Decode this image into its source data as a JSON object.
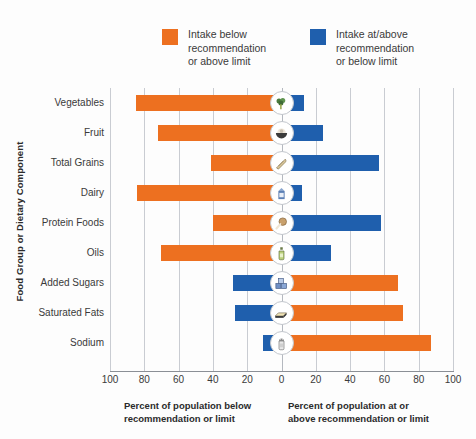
{
  "chart_data": {
    "type": "bar",
    "orientation": "horizontal",
    "subtype": "diverging-bar",
    "title": "",
    "xlabel_left": "Percent of population below recommendation or limit",
    "xlabel_right": "Percent of population at or above recommendation or limit",
    "ylabel": "Food Group or Dietary Component",
    "xlim": [
      -100,
      100
    ],
    "xticks": [
      -100,
      -80,
      -60,
      -40,
      -20,
      0,
      20,
      40,
      60,
      80,
      100
    ],
    "xtick_labels": [
      "100",
      "80",
      "60",
      "40",
      "20",
      "0",
      "20",
      "40",
      "60",
      "80",
      "100"
    ],
    "grid": true,
    "legend_position": "top",
    "colors": {
      "negative": "#ED7020",
      "positive": "#1F5FAD",
      "gridline": "#c9ccd2",
      "axis": "#8b8f96",
      "text": "#3a3a3a"
    },
    "legend": [
      {
        "label": "Intake below recommendation or above limit",
        "color": "#ED7020",
        "key": "negative"
      },
      {
        "label": "Intake at/above recommendation or below limit",
        "color": "#1F5FAD",
        "key": "positive"
      }
    ],
    "categories": [
      "Vegetables",
      "Fruit",
      "Total Grains",
      "Dairy",
      "Protein Foods",
      "Oils",
      "Added Sugars",
      "Saturated Fats",
      "Sodium"
    ],
    "series": [
      {
        "name": "Intake below recommendation or above limit",
        "color": "#ED7020",
        "values": [
          85,
          72,
          41,
          84,
          40,
          70,
          0,
          0,
          0
        ]
      },
      {
        "name": "Intake at/above recommendation or below limit",
        "color": "#1F5FAD",
        "values": [
          13,
          24,
          57,
          12,
          58,
          29,
          0,
          0,
          0
        ]
      }
    ],
    "rows": [
      {
        "category": "Vegetables",
        "below": 85,
        "above": 13,
        "icon": "broccoli-icon"
      },
      {
        "category": "Fruit",
        "below": 72,
        "above": 24,
        "icon": "fruit-bowl-icon"
      },
      {
        "category": "Total Grains",
        "below": 41,
        "above": 57,
        "icon": "grain-bread-icon"
      },
      {
        "category": "Dairy",
        "below": 84,
        "above": 12,
        "icon": "milk-carton-icon"
      },
      {
        "category": "Protein Foods",
        "below": 40,
        "above": 58,
        "icon": "protein-drumstick-icon"
      },
      {
        "category": "Oils",
        "below": 70,
        "above": 29,
        "icon": "oil-bottle-icon"
      },
      {
        "category": "Added Sugars",
        "below": 68,
        "above": 28,
        "icon": "sugar-cubes-icon",
        "flipped": true
      },
      {
        "category": "Saturated Fats",
        "below": 71,
        "above": 27,
        "icon": "butter-icon",
        "flipped": true
      },
      {
        "category": "Sodium",
        "below": 87,
        "above": 11,
        "icon": "salt-shaker-icon",
        "flipped": true
      }
    ]
  },
  "legend": {
    "left": {
      "line1": "Intake below",
      "line2": "recommendation",
      "line3": "or above limit",
      "color": "#ED7020"
    },
    "right": {
      "line1": "Intake at/above",
      "line2": "recommendation",
      "line3": "or below limit",
      "color": "#1F5FAD"
    }
  },
  "axis": {
    "y_title": "Food Group or Dietary Component",
    "caption_left": {
      "line1": "Percent of population below",
      "line2": "recommendation or limit"
    },
    "caption_right": {
      "line1": "Percent of population at or",
      "line2": "above recommendation or limit"
    }
  }
}
